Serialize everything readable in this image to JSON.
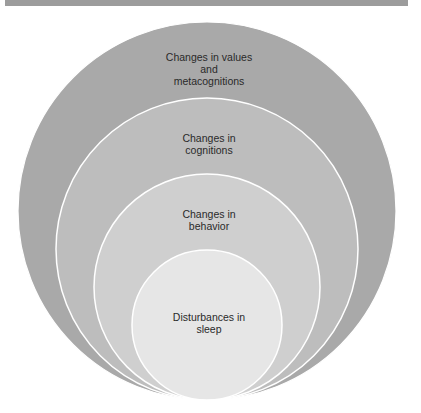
{
  "diagram": {
    "type": "nested-circles",
    "circles": [
      {
        "label_lines": [
          "Changes in values",
          "and",
          "metacognitions"
        ],
        "fill": "#a9a9a9",
        "cx": 207,
        "cy": 211,
        "r": 189
      },
      {
        "label_lines": [
          "Changes in",
          "cognitions"
        ],
        "fill": "#bdbdbd",
        "cx": 207,
        "cy": 249,
        "r": 151
      },
      {
        "label_lines": [
          "Changes in",
          "behavior"
        ],
        "fill": "#cfcfcf",
        "cx": 207,
        "cy": 287,
        "r": 113
      },
      {
        "label_lines": [
          "Disturbances in",
          "sleep"
        ],
        "fill": "#e6e6e6",
        "cx": 207,
        "cy": 325,
        "r": 75
      }
    ],
    "stroke": "#ffffff"
  }
}
